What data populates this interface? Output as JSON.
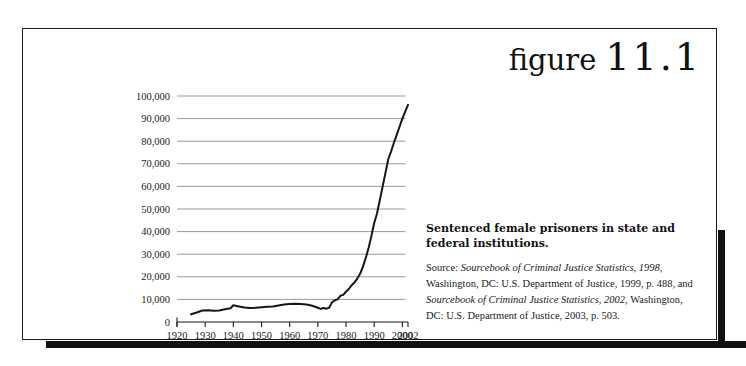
{
  "figure": {
    "word": "figure",
    "number": "11.1"
  },
  "caption": {
    "title": "Sentenced female prisoners in state and federal institutions.",
    "source_label": "Source:",
    "source_italic_1": "Sourcebook of Criminal Justice Statistics, 1998",
    "source_plain_1": ", Washington, DC: U.S. Department of Justice, 1999, p. 488, and ",
    "source_italic_2": "Sourcebook of Criminal Justice Statistics, 2002",
    "source_plain_2": ", Washington, DC: U.S. Department of Justice, 2003, p. 503.",
    "source_full": "Source: Sourcebook of Criminal Justice Statistics, 1998, Washington, DC: U.S. Department of Justice, 1999, p. 488, and Sourcebook of Criminal Justice Statistics, 2002, Washington, DC: U.S. Department of Justice, 2003, p. 503."
  },
  "chart_data": {
    "type": "line",
    "title": "Sentenced female prisoners in state and federal institutions.",
    "xlabel": "",
    "ylabel": "",
    "xlim": [
      1920,
      2002
    ],
    "ylim": [
      0,
      100000
    ],
    "grid": true,
    "legend": "none",
    "ytick_labels": [
      "0",
      "10,000",
      "20,000",
      "30,000",
      "40,000",
      "50,000",
      "60,000",
      "70,000",
      "80,000",
      "90,000",
      "100,000"
    ],
    "ytick_values": [
      0,
      10000,
      20000,
      30000,
      40000,
      50000,
      60000,
      70000,
      80000,
      90000,
      100000
    ],
    "xtick_labels": [
      "1920",
      "1930",
      "1940",
      "1950",
      "1960",
      "1970",
      "1980",
      "1990",
      "2000",
      "2002"
    ],
    "xtick_values": [
      1920,
      1930,
      1940,
      1950,
      1960,
      1970,
      1980,
      1990,
      2000,
      2002
    ],
    "series": [
      {
        "name": "Sentenced female prisoners",
        "x": [
          1925,
          1927,
          1929,
          1931,
          1933,
          1935,
          1937,
          1939,
          1940,
          1942,
          1944,
          1946,
          1948,
          1950,
          1952,
          1954,
          1956,
          1958,
          1960,
          1962,
          1964,
          1966,
          1968,
          1970,
          1971,
          1972,
          1973,
          1974,
          1975,
          1976,
          1977,
          1978,
          1979,
          1980,
          1981,
          1982,
          1983,
          1984,
          1985,
          1986,
          1987,
          1988,
          1989,
          1990,
          1991,
          1992,
          1993,
          1994,
          1995,
          1996,
          1997,
          1998,
          1999,
          2000,
          2001,
          2002
        ],
        "values": [
          3400,
          4200,
          5100,
          5200,
          5000,
          5100,
          5600,
          6100,
          7400,
          6900,
          6400,
          6200,
          6300,
          6500,
          6700,
          6900,
          7300,
          7700,
          8000,
          8100,
          8000,
          7700,
          7200,
          6300,
          5800,
          6200,
          5900,
          6300,
          8700,
          9600,
          10000,
          11600,
          12000,
          13400,
          14600,
          16300,
          17500,
          19200,
          21300,
          24500,
          28300,
          32700,
          38000,
          43800,
          48000,
          54000,
          60000,
          66000,
          72000,
          75500,
          79300,
          82800,
          86400,
          90000,
          93100,
          96100
        ]
      }
    ]
  }
}
